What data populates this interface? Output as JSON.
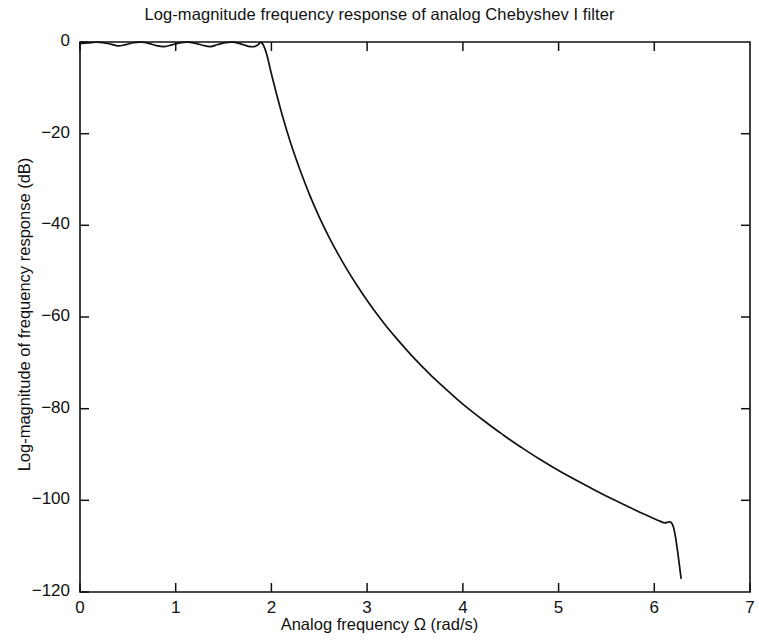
{
  "chart_data": {
    "type": "line",
    "title": "Log-magnitude frequency response of analog Chebyshev I filter",
    "xlabel": "Analog frequency Ω (rad/s)",
    "ylabel": "Log-magnitude of frequency response (dB)",
    "xlim": [
      0,
      7
    ],
    "ylim": [
      -120,
      0
    ],
    "xticks": [
      0,
      1,
      2,
      3,
      4,
      5,
      6,
      7
    ],
    "xtick_labels": [
      "0",
      "1",
      "2",
      "3",
      "4",
      "5",
      "6",
      "7"
    ],
    "yticks": [
      0,
      -20,
      -40,
      -60,
      -80,
      -100,
      -120
    ],
    "ytick_labels": [
      "0",
      "−20",
      "−40",
      "−60",
      "−80",
      "−100",
      "−120"
    ],
    "grid": false,
    "legend": null,
    "line_color": "#111111",
    "series": [
      {
        "name": "Chebyshev I log-magnitude response",
        "x": [
          0.0,
          0.08,
          0.16,
          0.24,
          0.32,
          0.4,
          0.48,
          0.56,
          0.64,
          0.72,
          0.8,
          0.88,
          0.96,
          1.04,
          1.12,
          1.2,
          1.28,
          1.36,
          1.44,
          1.52,
          1.6,
          1.68,
          1.76,
          1.82,
          1.86,
          1.9,
          1.95,
          2.0,
          2.1,
          2.2,
          2.3,
          2.4,
          2.5,
          2.6,
          2.7,
          2.8,
          2.9,
          3.0,
          3.1,
          3.2,
          3.3,
          3.4,
          3.5,
          3.6,
          3.7,
          3.8,
          3.9,
          4.0,
          4.1,
          4.2,
          4.3,
          4.4,
          4.5,
          4.6,
          4.8,
          5.0,
          5.2,
          5.4,
          5.6,
          5.8,
          6.0,
          6.1,
          6.2,
          6.28
        ],
        "y": [
          -0.3,
          -0.22,
          -0.05,
          -0.12,
          -0.45,
          -0.85,
          -0.56,
          -0.14,
          -0.03,
          -0.3,
          -0.8,
          -1.0,
          -0.62,
          -0.18,
          -0.02,
          -0.25,
          -0.7,
          -1.0,
          -0.55,
          -0.12,
          -0.04,
          -0.4,
          -0.95,
          -1.0,
          -0.6,
          -0.2,
          -2.6,
          -7.0,
          -15.0,
          -22.0,
          -28.0,
          -33.4,
          -38.2,
          -42.5,
          -46.4,
          -50.0,
          -53.3,
          -56.4,
          -59.3,
          -62.0,
          -64.5,
          -66.9,
          -69.2,
          -71.3,
          -73.4,
          -75.3,
          -77.2,
          -79.0,
          -80.7,
          -82.3,
          -83.9,
          -85.4,
          -86.9,
          -88.3,
          -91.0,
          -93.5,
          -95.8,
          -98.0,
          -100.1,
          -102.1,
          -104.0,
          -104.9,
          -105.8,
          -117.0
        ],
        "description": "Equiripple passband with 4 ripple lobes up to cutoff near 1.9 rad/s, then monotonic rolloff to about -117 dB at 6.28 rad/s"
      }
    ],
    "passband_ripple_db": 1.0,
    "cutoff_frequency": 1.9,
    "curve_end_x": 6.28,
    "curve_end_y": -117
  },
  "plot_box": {
    "left_px": 80,
    "right_px": 750,
    "top_px": 42,
    "bottom_px": 592
  }
}
